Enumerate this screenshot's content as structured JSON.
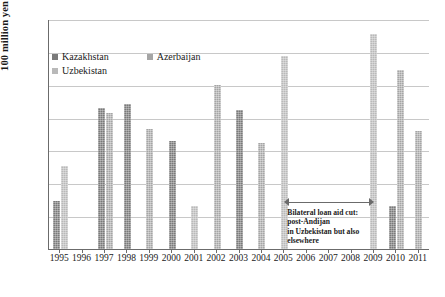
{
  "chart_data": {
    "type": "bar",
    "title": "",
    "xlabel": "",
    "ylabel": "100 million yen",
    "ylim": [
      0,
      350
    ],
    "ytick_step": 50,
    "yticks": [
      "0",
      "50",
      "100",
      "150",
      "200",
      "250",
      "300",
      "350"
    ],
    "grid": true,
    "legend_position": "top-left",
    "categories": [
      "1995",
      "1996",
      "1997",
      "1998",
      "1999",
      "2000",
      "2001",
      "2002",
      "2003",
      "2004",
      "2005",
      "2006",
      "2007",
      "2008",
      "2009",
      "2010",
      "2011"
    ],
    "series": [
      {
        "name": "Kazakhstan",
        "color": "#7a7a7a",
        "values": [
          73,
          null,
          215,
          220,
          null,
          164,
          null,
          null,
          212,
          null,
          null,
          null,
          null,
          null,
          null,
          65,
          null
        ]
      },
      {
        "name": "Azerbaijan",
        "color": "#a5a5a5",
        "values": [
          null,
          null,
          207,
          null,
          183,
          null,
          null,
          249,
          null,
          162,
          null,
          null,
          null,
          null,
          null,
          273,
          180
        ]
      },
      {
        "name": "Uzbekistan",
        "color": "#b9b9b9",
        "values": [
          127,
          null,
          null,
          null,
          null,
          null,
          65,
          null,
          null,
          null,
          293,
          null,
          null,
          null,
          327,
          null,
          null
        ]
      }
    ],
    "annotations": [
      {
        "name": "bilateral-loan-aid-cut",
        "arrow": "double-headed",
        "span_start": "2005",
        "span_end": "2009",
        "lines": [
          "Bilateral loan aid cut:",
          "post-Andijan",
          "in Uzbekistan but also",
          "elsewhere"
        ]
      }
    ]
  },
  "legend": {
    "items": [
      {
        "label": "Kazakhstan",
        "color": "#7a7a7a"
      },
      {
        "label": "Azerbaijan",
        "color": "#a5a5a5"
      },
      {
        "label": "Uzbekistan",
        "color": "#b9b9b9"
      }
    ]
  }
}
